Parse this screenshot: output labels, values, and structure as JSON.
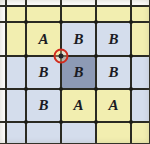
{
  "figure": {
    "title": ""
  },
  "palette": {
    "cell_yellow": "#f2eeb0",
    "cell_blue": "#d4ddec",
    "cell_blue_dark": "#8d9ab5",
    "gridline": "#2a2a22",
    "marker_ring": "#d12b1e",
    "marker_core": "#23232a",
    "label_text": "#1b1b23"
  },
  "grid": {
    "columns": 5,
    "rows": 5,
    "x_lines": [
      6,
      26,
      61,
      96,
      131,
      150
    ],
    "y_lines": [
      6,
      22,
      56,
      89,
      122,
      144
    ],
    "vertex_marker": {
      "x": 61,
      "y": 56,
      "label": ""
    }
  },
  "cells": [
    {
      "row": 0,
      "col": 0,
      "label": "",
      "color": "#f2eeb0"
    },
    {
      "row": 0,
      "col": 1,
      "label": "",
      "color": "#f2eeb0"
    },
    {
      "row": 0,
      "col": 2,
      "label": "",
      "color": "#f2eeb0"
    },
    {
      "row": 0,
      "col": 3,
      "label": "",
      "color": "#f2eeb0"
    },
    {
      "row": 0,
      "col": 4,
      "label": "",
      "color": "#f2eeb0"
    },
    {
      "row": 1,
      "col": 0,
      "label": "",
      "color": "#f2eeb0"
    },
    {
      "row": 1,
      "col": 1,
      "label": "A",
      "color": "#f2eeb0"
    },
    {
      "row": 1,
      "col": 2,
      "label": "B",
      "color": "#d4ddec"
    },
    {
      "row": 1,
      "col": 3,
      "label": "B",
      "color": "#d4ddec"
    },
    {
      "row": 1,
      "col": 4,
      "label": "",
      "color": "#f2eeb0"
    },
    {
      "row": 2,
      "col": 0,
      "label": "",
      "color": "#d4ddec"
    },
    {
      "row": 2,
      "col": 1,
      "label": "B",
      "color": "#d4ddec"
    },
    {
      "row": 2,
      "col": 2,
      "label": "B",
      "color": "#8d9ab5"
    },
    {
      "row": 2,
      "col": 3,
      "label": "B",
      "color": "#d4ddec"
    },
    {
      "row": 2,
      "col": 4,
      "label": "",
      "color": "#d4ddec"
    },
    {
      "row": 3,
      "col": 0,
      "label": "",
      "color": "#d4ddec"
    },
    {
      "row": 3,
      "col": 1,
      "label": "B",
      "color": "#d4ddec"
    },
    {
      "row": 3,
      "col": 2,
      "label": "A",
      "color": "#f2eeb0"
    },
    {
      "row": 3,
      "col": 3,
      "label": "A",
      "color": "#f2eeb0"
    },
    {
      "row": 3,
      "col": 4,
      "label": "",
      "color": "#d4ddec"
    },
    {
      "row": 4,
      "col": 0,
      "label": "",
      "color": "#d4ddec"
    },
    {
      "row": 4,
      "col": 1,
      "label": "",
      "color": "#d4ddec"
    },
    {
      "row": 4,
      "col": 2,
      "label": "",
      "color": "#d4ddec"
    },
    {
      "row": 4,
      "col": 3,
      "label": "",
      "color": "#f2eeb0"
    },
    {
      "row": 4,
      "col": 4,
      "label": "",
      "color": "#f2eeb0"
    }
  ]
}
